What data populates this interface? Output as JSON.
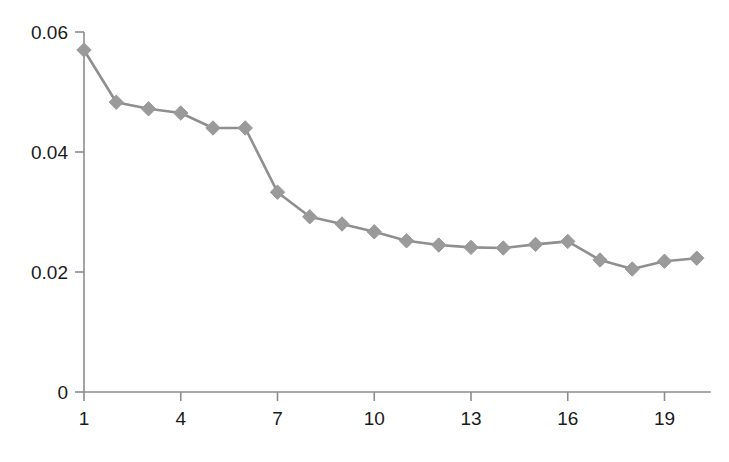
{
  "chart_data": {
    "type": "line",
    "title": "",
    "subtitle": "",
    "xlabel": "",
    "ylabel": "",
    "x": [
      1,
      2,
      3,
      4,
      5,
      6,
      7,
      8,
      9,
      10,
      11,
      12,
      13,
      14,
      15,
      16,
      17,
      18,
      19,
      20
    ],
    "values": [
      0.057,
      0.0483,
      0.0472,
      0.0465,
      0.044,
      0.044,
      0.0333,
      0.0292,
      0.028,
      0.0267,
      0.0252,
      0.0245,
      0.0241,
      0.024,
      0.0246,
      0.0251,
      0.022,
      0.0205,
      0.0218,
      0.0223
    ],
    "series": [
      {
        "name": "series-1",
        "values": [
          0.057,
          0.0483,
          0.0472,
          0.0465,
          0.044,
          0.044,
          0.0333,
          0.0292,
          0.028,
          0.0267,
          0.0252,
          0.0245,
          0.0241,
          0.024,
          0.0246,
          0.0251,
          0.022,
          0.0205,
          0.0218,
          0.0223
        ],
        "color": "#8f8f8f",
        "marker": "diamond"
      }
    ],
    "xlim": [
      1,
      20
    ],
    "ylim": [
      0,
      0.06
    ],
    "x_ticks": [
      1,
      4,
      7,
      10,
      13,
      16,
      19
    ],
    "x_tick_labels": [
      "1",
      "4",
      "7",
      "10",
      "13",
      "16",
      "19"
    ],
    "y_ticks": [
      0,
      0.02,
      0.04,
      0.06
    ],
    "y_tick_labels": [
      "0",
      "0.02",
      "0.04",
      "0.06"
    ],
    "grid": false,
    "legend": false,
    "legend_position": "none",
    "annotations": []
  },
  "style": {
    "line_color": "#8f8f8f",
    "marker_color": "#9a9a9a",
    "axis_color": "#8c8c8c",
    "text_color": "#1a1a1a",
    "background": "#ffffff"
  }
}
